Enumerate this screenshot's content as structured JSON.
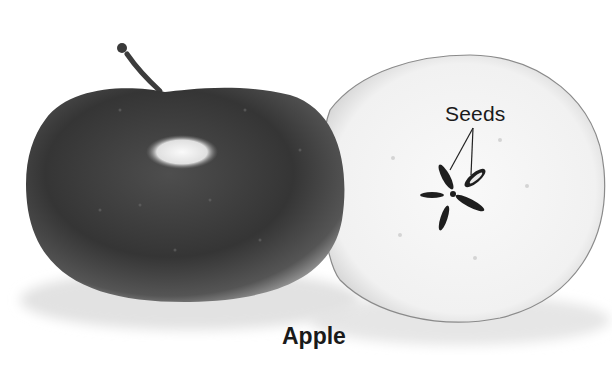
{
  "figure": {
    "caption": "Apple",
    "labels": {
      "seeds": "Seeds"
    },
    "parts": [
      {
        "name": "whole-apple",
        "description": "Whole dark apple with stem"
      },
      {
        "name": "apple-cross-section",
        "description": "Apple cut horizontally showing star-shaped core with five seeds"
      }
    ],
    "colors": {
      "apple_skin": "#3a3a3a",
      "flesh": "#f4f4f4",
      "seed": "#1e1e1e",
      "text": "#1a1a1a"
    }
  }
}
